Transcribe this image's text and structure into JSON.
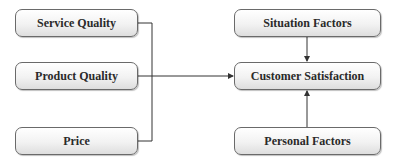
{
  "diagram": {
    "type": "flow",
    "nodes": {
      "service_quality": "Service Quality",
      "product_quality": "Product Quality",
      "price": "Price",
      "situation_factors": "Situation Factors",
      "customer_satisfaction": "Customer Satisfaction",
      "personal_factors": "Personal Factors"
    },
    "edges": [
      {
        "from": "service_quality",
        "to": "customer_satisfaction"
      },
      {
        "from": "product_quality",
        "to": "customer_satisfaction"
      },
      {
        "from": "price",
        "to": "customer_satisfaction"
      },
      {
        "from": "situation_factors",
        "to": "customer_satisfaction"
      },
      {
        "from": "personal_factors",
        "to": "customer_satisfaction"
      }
    ]
  }
}
